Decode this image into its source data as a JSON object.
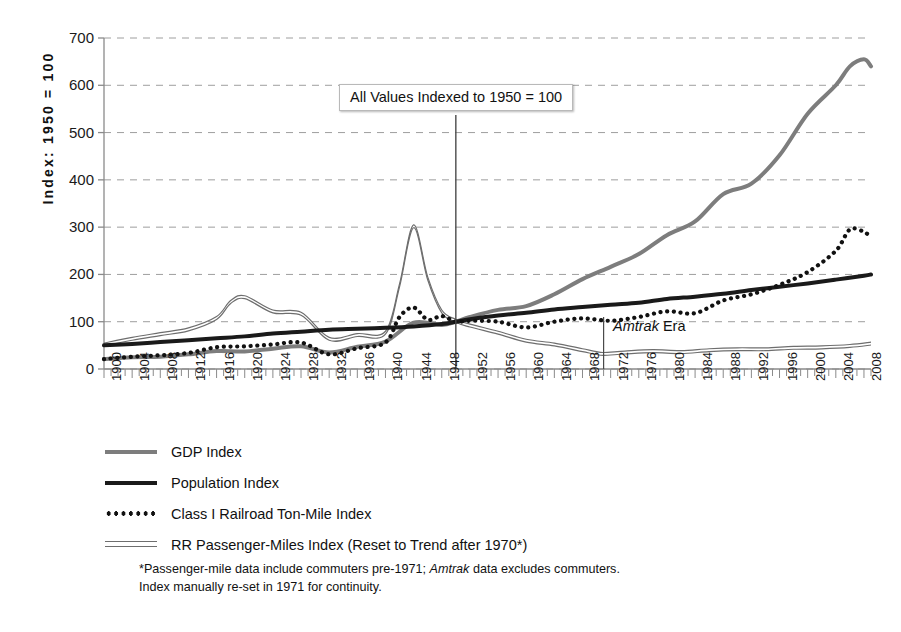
{
  "chart_data": {
    "type": "line",
    "title": "",
    "subtitle": "",
    "xlabel": "",
    "ylabel": "Index: 1950 = 100",
    "xlim": [
      1900,
      2009
    ],
    "ylim": [
      0,
      700
    ],
    "ytick_step": 100,
    "yticks": [
      0,
      100,
      200,
      300,
      400,
      500,
      600,
      700
    ],
    "xticks": [
      1900,
      1904,
      1908,
      1912,
      1916,
      1920,
      1924,
      1928,
      1932,
      1936,
      1940,
      1944,
      1948,
      1952,
      1956,
      1960,
      1964,
      1968,
      1972,
      1976,
      1980,
      1984,
      1988,
      1992,
      1996,
      2000,
      2004,
      2008
    ],
    "xtick_minor_step": 1,
    "grid": "horizontal-dashed",
    "legend_position": "below-plot-left",
    "annotations": [
      {
        "name": "index-base-callout",
        "text": "All Values Indexed to 1950 = 100",
        "x": 1950,
        "style": "boxed-with-drop-line"
      },
      {
        "name": "amtrak-era-marker",
        "text_italic": "Amtrak",
        "text_rest": " Era",
        "x": 1971,
        "style": "vertical-tick-with-label"
      }
    ],
    "series": [
      {
        "name": "GDP Index",
        "color": "#7d7d7d",
        "style": "thick-solid",
        "x": [
          1900,
          1904,
          1908,
          1912,
          1916,
          1920,
          1924,
          1928,
          1932,
          1936,
          1940,
          1944,
          1948,
          1950,
          1952,
          1956,
          1960,
          1964,
          1968,
          1972,
          1976,
          1980,
          1984,
          1988,
          1992,
          1996,
          2000,
          2004,
          2006,
          2008,
          2009
        ],
        "values": [
          21,
          25,
          26,
          31,
          38,
          37,
          43,
          48,
          35,
          47,
          58,
          98,
          93,
          100,
          110,
          125,
          133,
          158,
          190,
          216,
          243,
          283,
          312,
          370,
          392,
          452,
          540,
          600,
          640,
          655,
          640
        ]
      },
      {
        "name": "Population Index",
        "color": "#1a1a1a",
        "style": "thick-solid",
        "x": [
          1900,
          1904,
          1908,
          1912,
          1916,
          1920,
          1924,
          1928,
          1932,
          1936,
          1940,
          1944,
          1948,
          1950,
          1952,
          1956,
          1960,
          1964,
          1968,
          1972,
          1976,
          1980,
          1984,
          1988,
          1992,
          1996,
          2000,
          2004,
          2008,
          2009
        ],
        "values": [
          50,
          53,
          57,
          61,
          65,
          69,
          75,
          79,
          83,
          85,
          87,
          90,
          95,
          100,
          105,
          113,
          119,
          126,
          131,
          136,
          140,
          148,
          153,
          159,
          167,
          174,
          181,
          189,
          197,
          200
        ]
      },
      {
        "name": "Class I Railroad Ton-Mile Index",
        "color": "#111111",
        "style": "dotted",
        "x": [
          1900,
          1904,
          1908,
          1912,
          1916,
          1920,
          1924,
          1928,
          1932,
          1936,
          1940,
          1942,
          1944,
          1946,
          1948,
          1950,
          1952,
          1956,
          1960,
          1964,
          1968,
          1972,
          1976,
          1980,
          1984,
          1988,
          1992,
          1996,
          2000,
          2004,
          2006,
          2008,
          2009
        ],
        "values": [
          21,
          26,
          29,
          34,
          46,
          48,
          52,
          56,
          31,
          44,
          56,
          110,
          130,
          104,
          112,
          100,
          102,
          100,
          88,
          100,
          107,
          102,
          110,
          122,
          118,
          145,
          158,
          178,
          205,
          250,
          295,
          290,
          278
        ]
      },
      {
        "name": "RR Passenger-Miles Index (Reset to Trend after 1970*)",
        "color": "#6e6e6e",
        "style": "thin-double",
        "x": [
          1900,
          1904,
          1908,
          1912,
          1916,
          1918,
          1920,
          1924,
          1928,
          1932,
          1936,
          1940,
          1942,
          1944,
          1946,
          1948,
          1950,
          1952,
          1956,
          1960,
          1964,
          1968,
          1970,
          1971,
          1974,
          1978,
          1982,
          1986,
          1990,
          1994,
          1998,
          2002,
          2006,
          2009
        ],
        "values": [
          50,
          62,
          72,
          82,
          106,
          140,
          150,
          120,
          115,
          62,
          70,
          75,
          175,
          300,
          190,
          120,
          100,
          90,
          75,
          58,
          50,
          38,
          32,
          30,
          33,
          36,
          34,
          38,
          40,
          40,
          43,
          44,
          47,
          52
        ],
        "note": "Index manually re-set in 1971; pre-1971 includes commuters"
      }
    ]
  },
  "legend": {
    "items": [
      {
        "key": "gdp",
        "label": "GDP Index"
      },
      {
        "key": "population",
        "label": "Population Index"
      },
      {
        "key": "ton-mile",
        "label": "Class I Railroad Ton-Mile Index"
      },
      {
        "key": "passenger-miles",
        "label": "RR Passenger-Miles Index (Reset to Trend after 1970*)"
      }
    ]
  },
  "footnote": {
    "line1_pre": "*Passenger-mile data include commuters pre-1971; ",
    "line1_italic": "Amtrak",
    "line1_post": " data excludes",
    "line2": "commuters. Index manually re-set in 1971 for continuity."
  },
  "colors": {
    "gdp": "#7d7d7d",
    "population": "#1a1a1a",
    "ton_mile": "#111111",
    "passenger_miles": "#6e6e6e",
    "grid": "#9e9e9e",
    "axis": "#8a8a8a",
    "background": "#ffffff"
  }
}
